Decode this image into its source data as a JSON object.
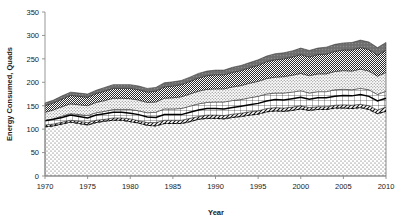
{
  "chart_data": {
    "type": "area",
    "title": "",
    "subtitle": "",
    "xlabel": "Year",
    "ylabel": "Energy Consumed, Quads",
    "x": [
      1970,
      1971,
      1972,
      1973,
      1974,
      1975,
      1976,
      1977,
      1978,
      1979,
      1980,
      1981,
      1982,
      1983,
      1984,
      1985,
      1986,
      1987,
      1988,
      1989,
      1990,
      1991,
      1992,
      1993,
      1994,
      1995,
      1996,
      1997,
      1998,
      1999,
      2000,
      2001,
      2002,
      2003,
      2004,
      2005,
      2006,
      2007,
      2008,
      2009,
      2010
    ],
    "xlim": [
      1970,
      2010
    ],
    "ylim": [
      0,
      350
    ],
    "xticks": [
      1970,
      1975,
      1980,
      1985,
      1990,
      1995,
      2000,
      2005,
      2010
    ],
    "yticks": [
      0,
      50,
      100,
      150,
      200,
      250,
      300,
      350
    ],
    "grid": false,
    "legend_position": "none",
    "stacked": true,
    "series": [
      {
        "name": "fossil-fuels",
        "pattern": "sparse-dots",
        "color": "#f2f2f2",
        "values": [
          105,
          107,
          111,
          115,
          112,
          109,
          114,
          117,
          119,
          119,
          116,
          113,
          108,
          107,
          112,
          112,
          112,
          116,
          121,
          123,
          123,
          122,
          125,
          127,
          130,
          132,
          137,
          139,
          138,
          140,
          143,
          140,
          142,
          142,
          145,
          145,
          144,
          146,
          142,
          133,
          138
        ]
      },
      {
        "name": "renewables",
        "pattern": "diagonal-hatch",
        "color": "#ffffff",
        "values": [
          4,
          4,
          4,
          4,
          5,
          5,
          5,
          4,
          5,
          5,
          6,
          5,
          6,
          7,
          7,
          7,
          7,
          7,
          6,
          7,
          7,
          7,
          7,
          7,
          7,
          7,
          7,
          7,
          7,
          7,
          7,
          6,
          6,
          6,
          6,
          7,
          7,
          7,
          8,
          8,
          9
        ]
      },
      {
        "name": "nuclear-and-electric-losses",
        "pattern": "grid",
        "color": "#ffffff",
        "values": [
          9,
          11,
          13,
          14,
          14,
          15,
          16,
          17,
          18,
          18,
          20,
          21,
          21,
          22,
          24,
          24,
          25,
          26,
          27,
          27,
          28,
          29,
          29,
          29,
          30,
          31,
          31,
          31,
          32,
          32,
          32,
          31,
          32,
          32,
          33,
          33,
          33,
          34,
          34,
          33,
          34
        ]
      },
      {
        "name": "transport-losses",
        "pattern": "fine-dots",
        "color": "#f7f7f7",
        "values": [
          18,
          19,
          20,
          21,
          21,
          21,
          22,
          23,
          24,
          24,
          23,
          23,
          22,
          22,
          23,
          24,
          25,
          26,
          27,
          28,
          28,
          28,
          29,
          30,
          31,
          32,
          33,
          34,
          35,
          36,
          37,
          37,
          38,
          38,
          39,
          40,
          40,
          41,
          40,
          39,
          40
        ]
      },
      {
        "name": "conversion-losses",
        "pattern": "dense-checker",
        "color": "#555555",
        "values": [
          14,
          15,
          16,
          18,
          18,
          18,
          19,
          20,
          21,
          21,
          22,
          22,
          22,
          23,
          24,
          25,
          26,
          27,
          28,
          29,
          30,
          30,
          31,
          32,
          33,
          34,
          36,
          37,
          38,
          39,
          40,
          40,
          41,
          42,
          43,
          44,
          45,
          46,
          46,
          45,
          47
        ]
      },
      {
        "name": "system-losses",
        "pattern": "dark-solid",
        "color": "#6e6e6e",
        "values": [
          6,
          6,
          7,
          7,
          7,
          7,
          7,
          8,
          8,
          8,
          8,
          8,
          8,
          8,
          9,
          9,
          9,
          9,
          10,
          10,
          10,
          10,
          11,
          11,
          11,
          12,
          12,
          13,
          13,
          13,
          14,
          14,
          14,
          15,
          15,
          15,
          16,
          16,
          16,
          16,
          17
        ]
      }
    ],
    "overlay_lines": [
      {
        "name": "solid-bold-line",
        "style": "solid",
        "values": [
          118,
          121,
          125,
          130,
          127,
          124,
          130,
          133,
          136,
          136,
          134,
          131,
          126,
          125,
          131,
          131,
          131,
          136,
          141,
          144,
          144,
          143,
          146,
          149,
          152,
          155,
          160,
          163,
          162,
          165,
          168,
          164,
          167,
          167,
          170,
          172,
          171,
          174,
          170,
          160,
          166
        ]
      },
      {
        "name": "dashed-line",
        "style": "dashed",
        "values": [
          105,
          107,
          111,
          115,
          112,
          109,
          114,
          117,
          119,
          119,
          116,
          113,
          108,
          107,
          112,
          112,
          112,
          116,
          121,
          123,
          123,
          122,
          125,
          127,
          130,
          132,
          137,
          139,
          138,
          140,
          143,
          140,
          142,
          142,
          145,
          145,
          144,
          146,
          142,
          133,
          138
        ]
      }
    ]
  }
}
